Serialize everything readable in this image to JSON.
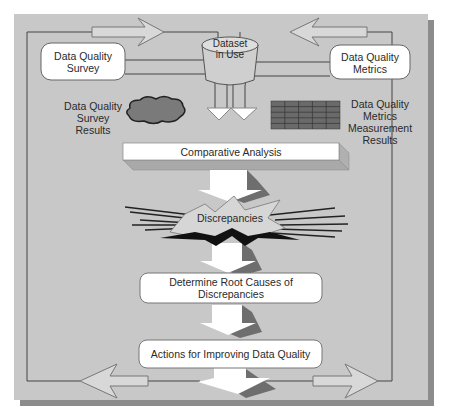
{
  "diagram": {
    "top_left_box": {
      "line1": "Data Quality",
      "line2": "Survey"
    },
    "top_right_box": {
      "line1": "Data Quality",
      "line2": "Metrics"
    },
    "dataset": {
      "line1": "Dataset",
      "line2": "in Use"
    },
    "survey_results": {
      "line1": "Data Quality",
      "line2": "Survey",
      "line3": "Results"
    },
    "metrics_results": {
      "line1": "Data Quality",
      "line2": "Metrics",
      "line3": "Measurement",
      "line4": "Results"
    },
    "comparative_analysis": "Comparative Analysis",
    "discrepancies": "Discrepancies",
    "root_causes": {
      "line1": "Determine Root Causes of",
      "line2": "Discrepancies"
    },
    "actions": "Actions for Improving Data Quality"
  },
  "colors": {
    "page_bg": "#ffffff",
    "panel_bg": "#c8c8c8",
    "panel_shadow": "#8c8c8c",
    "box_fill": "#ffffff",
    "cloud_fill": "#7a7a7a",
    "grid_fill": "#6a6a6a",
    "arrow_shadow": "#6e6e6e",
    "line": "#444444"
  }
}
